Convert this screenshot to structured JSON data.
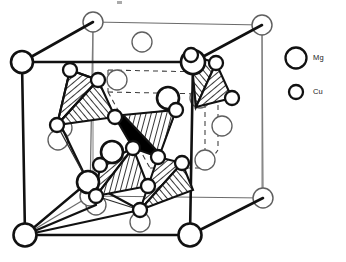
{
  "figure": {
    "title_fragment": "",
    "cell_type": "cubic-unit-cell"
  },
  "legend": {
    "items": [
      {
        "symbol": "Mg",
        "label": "Mg",
        "radius": 10.5,
        "kind": "large-circle",
        "stroke": "#111111",
        "fill": "#ffffff"
      },
      {
        "symbol": "Cu",
        "label": "Cu",
        "radius": 7.0,
        "kind": "small-circle",
        "stroke": "#111111",
        "fill": "#ffffff"
      }
    ]
  },
  "colors": {
    "ink": "#111111",
    "thin_ink": "#6b6b6b",
    "paper": "#ffffff",
    "hatch": "#111111",
    "solid_face": "#000000"
  },
  "structure": {
    "cube": {
      "front_face": [
        {
          "name": "front-top-left",
          "x": 22,
          "y": 62
        },
        {
          "name": "front-top-right",
          "x": 193,
          "y": 62
        },
        {
          "name": "front-bottom-right",
          "x": 190,
          "y": 235
        },
        {
          "name": "front-bottom-left",
          "x": 25,
          "y": 235
        }
      ],
      "back_face": [
        {
          "name": "back-top-left",
          "x": 93,
          "y": 22
        },
        {
          "name": "back-top-right",
          "x": 262,
          "y": 25
        },
        {
          "name": "back-bottom-right",
          "x": 263,
          "y": 198
        },
        {
          "name": "back-bottom-left",
          "x": 90,
          "y": 196
        }
      ]
    },
    "mg_atoms": [
      {
        "id": "mg-ftl",
        "x": 22,
        "y": 62,
        "r": 11,
        "weight": "bold"
      },
      {
        "id": "mg-ftr",
        "x": 193,
        "y": 62,
        "r": 12,
        "weight": "bold"
      },
      {
        "id": "mg-fbl",
        "x": 25,
        "y": 235,
        "r": 11.5,
        "weight": "bold"
      },
      {
        "id": "mg-fbr",
        "x": 190,
        "y": 235,
        "r": 11.5,
        "weight": "bold"
      },
      {
        "id": "mg-btl",
        "x": 93,
        "y": 22,
        "r": 10,
        "weight": "thin"
      },
      {
        "id": "mg-btr",
        "x": 262,
        "y": 25,
        "r": 10,
        "weight": "thin"
      },
      {
        "id": "mg-bbl",
        "x": 90,
        "y": 196,
        "r": 10,
        "weight": "thin"
      },
      {
        "id": "mg-bbr",
        "x": 263,
        "y": 198,
        "r": 10,
        "weight": "thin"
      },
      {
        "id": "mg-back-top-face",
        "x": 142,
        "y": 42,
        "r": 10,
        "weight": "thin"
      },
      {
        "id": "mg-back-center-face",
        "x": 117,
        "y": 80,
        "r": 10,
        "weight": "thin"
      },
      {
        "id": "mg-right-upper",
        "x": 222,
        "y": 126,
        "r": 10,
        "weight": "thin"
      },
      {
        "id": "mg-right-lower",
        "x": 205,
        "y": 160,
        "r": 10,
        "weight": "thin"
      },
      {
        "id": "mg-right-mid",
        "x": 200,
        "y": 98,
        "r": 10,
        "weight": "thin"
      },
      {
        "id": "mg-interior-upper",
        "x": 168,
        "y": 98,
        "r": 11,
        "weight": "bold"
      },
      {
        "id": "mg-interior-lower",
        "x": 112,
        "y": 152,
        "r": 11,
        "weight": "bold"
      },
      {
        "id": "mg-front-lower-left",
        "x": 88,
        "y": 182,
        "r": 11,
        "weight": "bold"
      },
      {
        "id": "mg-bottom-center",
        "x": 140,
        "y": 222,
        "r": 10,
        "weight": "thin"
      },
      {
        "id": "mg-left-mid",
        "x": 58,
        "y": 140,
        "r": 10,
        "weight": "thin"
      },
      {
        "id": "mg-left-low",
        "x": 96,
        "y": 205,
        "r": 10,
        "weight": "thin"
      },
      {
        "id": "mg-top-left-back",
        "x": 62,
        "y": 128,
        "r": 10,
        "weight": "thin"
      }
    ],
    "cu_tetrahedra": [
      {
        "id": "cu-tet-upper-left",
        "vertices": [
          {
            "x": 70,
            "y": 70
          },
          {
            "x": 98,
            "y": 80
          },
          {
            "x": 57,
            "y": 125
          },
          {
            "x": 115,
            "y": 117
          }
        ],
        "shading": "hatched"
      },
      {
        "id": "cu-tet-upper-right",
        "vertices": [
          {
            "x": 191,
            "y": 55
          },
          {
            "x": 216,
            "y": 63
          },
          {
            "x": 232,
            "y": 98
          },
          {
            "x": 196,
            "y": 107
          }
        ],
        "shading": "hatched"
      },
      {
        "id": "cu-tet-center",
        "vertices": [
          {
            "x": 115,
            "y": 117
          },
          {
            "x": 176,
            "y": 110
          },
          {
            "x": 158,
            "y": 157
          },
          {
            "x": 133,
            "y": 148
          }
        ],
        "shading": "solid-and-hatched"
      },
      {
        "id": "cu-tet-lower-left",
        "vertices": [
          {
            "x": 133,
            "y": 148
          },
          {
            "x": 100,
            "y": 165
          },
          {
            "x": 96,
            "y": 196
          },
          {
            "x": 148,
            "y": 186
          }
        ],
        "shading": "hatched"
      },
      {
        "id": "cu-tet-lower-right",
        "vertices": [
          {
            "x": 158,
            "y": 157
          },
          {
            "x": 182,
            "y": 163
          },
          {
            "x": 193,
            "y": 190
          },
          {
            "x": 140,
            "y": 210
          }
        ],
        "shading": "hatched"
      }
    ],
    "cu_atoms": [
      {
        "id": "cu-1",
        "x": 70,
        "y": 70,
        "r": 7
      },
      {
        "id": "cu-2",
        "x": 98,
        "y": 80,
        "r": 7
      },
      {
        "id": "cu-3",
        "x": 57,
        "y": 125,
        "r": 7
      },
      {
        "id": "cu-4",
        "x": 115,
        "y": 117,
        "r": 7
      },
      {
        "id": "cu-5",
        "x": 191,
        "y": 55,
        "r": 7
      },
      {
        "id": "cu-6",
        "x": 216,
        "y": 63,
        "r": 7
      },
      {
        "id": "cu-7",
        "x": 232,
        "y": 98,
        "r": 7
      },
      {
        "id": "cu-8",
        "x": 176,
        "y": 110,
        "r": 7
      },
      {
        "id": "cu-9",
        "x": 133,
        "y": 148,
        "r": 7
      },
      {
        "id": "cu-10",
        "x": 158,
        "y": 157,
        "r": 7
      },
      {
        "id": "cu-11",
        "x": 100,
        "y": 165,
        "r": 7
      },
      {
        "id": "cu-12",
        "x": 96,
        "y": 196,
        "r": 7
      },
      {
        "id": "cu-13",
        "x": 148,
        "y": 186,
        "r": 7
      },
      {
        "id": "cu-14",
        "x": 182,
        "y": 163,
        "r": 7
      },
      {
        "id": "cu-15",
        "x": 140,
        "y": 210,
        "r": 7
      }
    ],
    "mg_bonds": [
      {
        "from": [
          22,
          62
        ],
        "to": [
          93,
          22
        ]
      },
      {
        "from": [
          193,
          62
        ],
        "to": [
          262,
          25
        ]
      },
      {
        "from": [
          25,
          235
        ],
        "to": [
          88,
          182
        ]
      },
      {
        "from": [
          25,
          235
        ],
        "to": [
          96,
          205
        ]
      },
      {
        "from": [
          25,
          235
        ],
        "to": [
          140,
          222
        ]
      },
      {
        "from": [
          190,
          235
        ],
        "to": [
          263,
          198
        ]
      },
      {
        "from": [
          88,
          182
        ],
        "to": [
          62,
          128
        ]
      },
      {
        "from": [
          88,
          182
        ],
        "to": [
          112,
          152
        ]
      },
      {
        "from": [
          88,
          182
        ],
        "to": [
          140,
          210
        ]
      },
      {
        "from": [
          193,
          62
        ],
        "to": [
          196,
          107
        ]
      }
    ]
  }
}
